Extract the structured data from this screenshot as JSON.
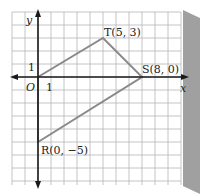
{
  "diagram": {
    "axes": {
      "x_label": "x",
      "y_label": "y",
      "origin_label": "O",
      "x_unit_label": "1",
      "y_unit_label": "1"
    },
    "points": [
      {
        "name": "T",
        "coords": "(5, 3)",
        "label": "T(5, 3)",
        "x": 5,
        "y": 3
      },
      {
        "name": "S",
        "coords": "(8, 0)",
        "label": "S(8, 0)",
        "x": 8,
        "y": 0
      },
      {
        "name": "R",
        "coords": "(0, -5)",
        "label": "R(0, −5)",
        "x": 0,
        "y": -5
      }
    ],
    "polygon": [
      "O",
      "T",
      "S",
      "R"
    ],
    "colors": {
      "polygon": "#8a8a8a",
      "axes": "#1a1a1a",
      "grid": "#b0b0b0",
      "shadow": "#9a9a9a"
    }
  }
}
